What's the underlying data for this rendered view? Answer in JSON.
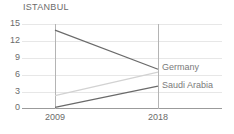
{
  "chart_data": {
    "type": "line",
    "title": "ISTANBUL",
    "xlabel": "",
    "ylabel": "",
    "x": [
      "2009",
      "2018"
    ],
    "categories": [
      "2009",
      "2018"
    ],
    "yticks": [
      15,
      12,
      9,
      6,
      3,
      0
    ],
    "ylim": [
      0,
      15
    ],
    "grid": true,
    "legend_position": "right-inline",
    "series": [
      {
        "name": "Germany",
        "values": [
          14.0,
          7.0
        ],
        "color": "#6a6a6a",
        "label_shown": true
      },
      {
        "name": "",
        "values": [
          2.3,
          6.5
        ],
        "color": "#d2d2d2",
        "label_shown": false
      },
      {
        "name": "Saudi Arabia",
        "values": [
          0.2,
          4.0
        ],
        "color": "#6a6a6a",
        "label_shown": true
      }
    ],
    "annotations": [
      {
        "text": "",
        "note": "very faint light-gray text near origin, illegible"
      }
    ]
  },
  "axis": {
    "y_tick_labels": [
      "15",
      "12",
      "9",
      "6",
      "3",
      "0"
    ],
    "x_tick_labels": [
      "2009",
      "2018"
    ]
  },
  "labels": {
    "germany": "Germany",
    "saudi_arabia": "Saudi Arabia"
  },
  "colors": {
    "line_dark": "#6a6a6a",
    "line_light": "#d2d2d2",
    "grid": "#e7e7e7",
    "axis": "#9b9b9b",
    "text": "#6b6b6b"
  }
}
